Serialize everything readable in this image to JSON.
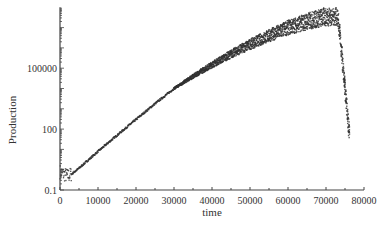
{
  "chart_data": {
    "type": "scatter",
    "title": "",
    "xlabel": "time",
    "ylabel": "Production",
    "xscale": "linear",
    "yscale": "log",
    "xlim": [
      0,
      80000
    ],
    "ylim": [
      0.1,
      100000000
    ],
    "xticks": [
      0,
      10000,
      20000,
      30000,
      40000,
      50000,
      60000,
      70000,
      80000
    ],
    "xtick_labels": [
      "0",
      "10000",
      "20000",
      "30000",
      "40000",
      "50000",
      "60000",
      "70000",
      "80000"
    ],
    "yticks": [
      0.1,
      100,
      100000
    ],
    "ytick_labels": [
      "0.1",
      "100",
      "100000"
    ],
    "grid": false,
    "legend": null,
    "marker_color": "#333333",
    "series": [
      {
        "name": "Production",
        "x": [
          0,
          1000,
          2000,
          3000,
          5000,
          10000,
          15000,
          20000,
          25000,
          30000,
          35000,
          40000,
          45000,
          50000,
          55000,
          60000,
          65000,
          70000,
          73000,
          73500,
          74000,
          74500,
          75000,
          75500,
          76000
        ],
        "values": [
          0.8,
          0.6,
          0.5,
          0.6,
          1.2,
          8,
          50,
          300,
          1800,
          10000,
          40000,
          150000,
          500000,
          1500000,
          4000000,
          10000000,
          20000000,
          35000000,
          40000000,
          10000000,
          1000000,
          100000,
          10000,
          1000,
          100
        ]
      }
    ]
  }
}
